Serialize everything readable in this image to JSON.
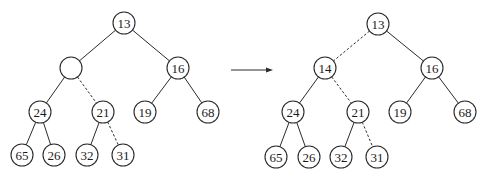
{
  "diagram": {
    "type": "binary-heap-transformation",
    "node_radius": 11,
    "colors": {
      "stroke": "#2a2a2a",
      "fill": "#ffffff",
      "text": "#1a1a1a"
    },
    "before": {
      "nodes": [
        {
          "id": "b13",
          "label": "13",
          "x": 124,
          "y": 23
        },
        {
          "id": "bhole",
          "label": "",
          "x": 71,
          "y": 68
        },
        {
          "id": "b16",
          "label": "16",
          "x": 178,
          "y": 68
        },
        {
          "id": "b24",
          "label": "24",
          "x": 40,
          "y": 112
        },
        {
          "id": "b21",
          "label": "21",
          "x": 103,
          "y": 112
        },
        {
          "id": "b19",
          "label": "19",
          "x": 145,
          "y": 112
        },
        {
          "id": "b68",
          "label": "68",
          "x": 208,
          "y": 112
        },
        {
          "id": "b65",
          "label": "65",
          "x": 22,
          "y": 155
        },
        {
          "id": "b26",
          "label": "26",
          "x": 54,
          "y": 155
        },
        {
          "id": "b32",
          "label": "32",
          "x": 87,
          "y": 155
        },
        {
          "id": "b31",
          "label": "31",
          "x": 123,
          "y": 155
        }
      ],
      "edges": [
        {
          "from": "b13",
          "to": "bhole",
          "style": "solid"
        },
        {
          "from": "b13",
          "to": "b16",
          "style": "solid"
        },
        {
          "from": "bhole",
          "to": "b24",
          "style": "solid"
        },
        {
          "from": "bhole",
          "to": "b21",
          "style": "dashed"
        },
        {
          "from": "b16",
          "to": "b19",
          "style": "solid"
        },
        {
          "from": "b16",
          "to": "b68",
          "style": "solid"
        },
        {
          "from": "b24",
          "to": "b65",
          "style": "solid"
        },
        {
          "from": "b24",
          "to": "b26",
          "style": "solid"
        },
        {
          "from": "b21",
          "to": "b32",
          "style": "solid"
        },
        {
          "from": "b21",
          "to": "b31",
          "style": "dashed"
        }
      ]
    },
    "arrow": {
      "x1": 231,
      "y1": 70,
      "x2": 273,
      "y2": 70
    },
    "after": {
      "nodes": [
        {
          "id": "a13",
          "label": "13",
          "x": 378,
          "y": 24
        },
        {
          "id": "a14",
          "label": "14",
          "x": 325,
          "y": 68
        },
        {
          "id": "a16",
          "label": "16",
          "x": 432,
          "y": 68
        },
        {
          "id": "a24",
          "label": "24",
          "x": 293,
          "y": 112
        },
        {
          "id": "a21",
          "label": "21",
          "x": 358,
          "y": 112
        },
        {
          "id": "a19",
          "label": "19",
          "x": 400,
          "y": 112
        },
        {
          "id": "a68",
          "label": "68",
          "x": 465,
          "y": 112
        },
        {
          "id": "a65",
          "label": "65",
          "x": 276,
          "y": 157
        },
        {
          "id": "a26",
          "label": "26",
          "x": 309,
          "y": 157
        },
        {
          "id": "a32",
          "label": "32",
          "x": 341,
          "y": 157
        },
        {
          "id": "a31",
          "label": "31",
          "x": 377,
          "y": 157
        }
      ],
      "edges": [
        {
          "from": "a13",
          "to": "a14",
          "style": "dashed"
        },
        {
          "from": "a13",
          "to": "a16",
          "style": "solid"
        },
        {
          "from": "a14",
          "to": "a24",
          "style": "solid"
        },
        {
          "from": "a14",
          "to": "a21",
          "style": "dashed"
        },
        {
          "from": "a16",
          "to": "a19",
          "style": "solid"
        },
        {
          "from": "a16",
          "to": "a68",
          "style": "solid"
        },
        {
          "from": "a24",
          "to": "a65",
          "style": "solid"
        },
        {
          "from": "a24",
          "to": "a26",
          "style": "solid"
        },
        {
          "from": "a21",
          "to": "a32",
          "style": "solid"
        },
        {
          "from": "a21",
          "to": "a31",
          "style": "dashed"
        }
      ]
    }
  }
}
